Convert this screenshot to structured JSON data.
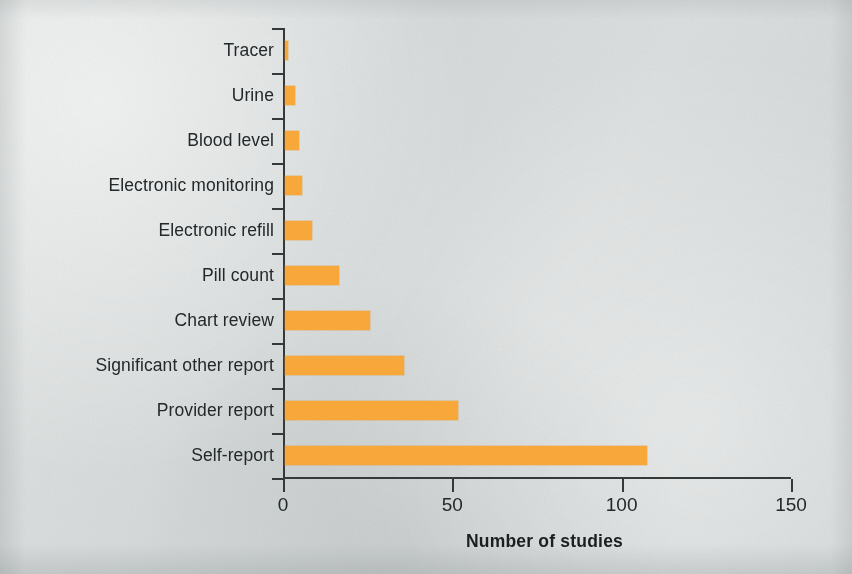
{
  "figure": {
    "background_color": "#d9dcdc",
    "bar_color": "#f8a83a",
    "axis_color": "#35393a",
    "text_color": "#23282a"
  },
  "chart_data": {
    "type": "bar",
    "orientation": "horizontal",
    "title": "",
    "xlabel": "Number of studies",
    "ylabel": "",
    "categories": [
      "Tracer",
      "Urine",
      "Blood level",
      "Electronic monitoring",
      "Electronic refill",
      "Pill count",
      "Chart review",
      "Significant other report",
      "Provider report",
      "Self-report"
    ],
    "values": [
      1,
      3,
      4,
      5,
      8,
      16,
      25,
      35,
      51,
      107
    ],
    "xlim": [
      0,
      150
    ],
    "xticks": [
      0,
      50,
      100,
      150
    ],
    "xtick_labels": [
      "0",
      "50",
      "100",
      "150"
    ],
    "grid": false,
    "legend": null
  }
}
